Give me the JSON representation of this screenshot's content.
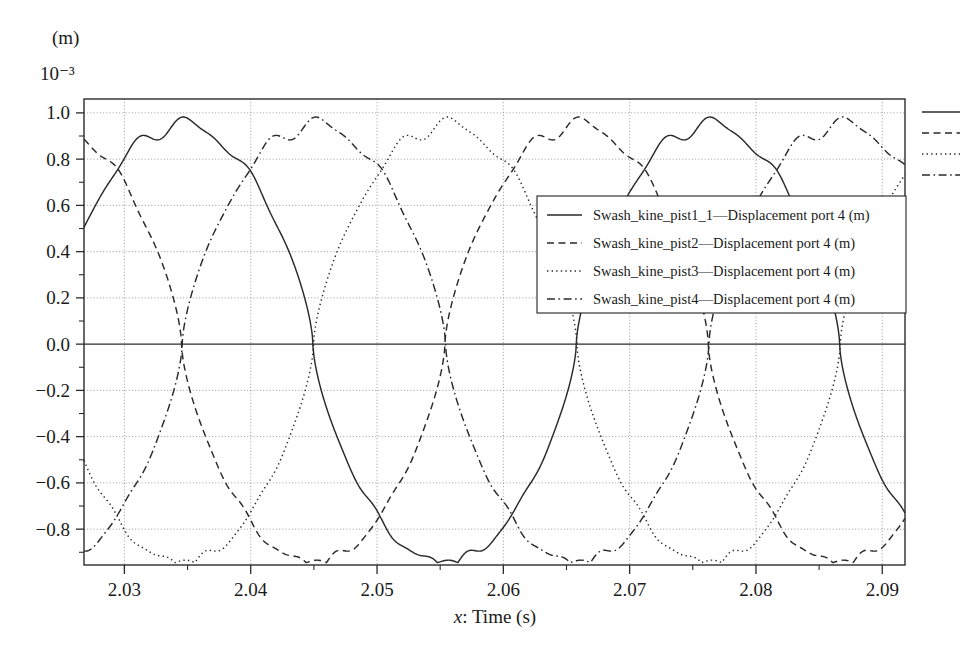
{
  "figure": {
    "y_unit_label": "(m)",
    "y_exponent_label": "10⁻³",
    "x_axis_title_prefix": "x",
    "x_axis_title_rest": ": Time (s)",
    "background_color": "#ffffff",
    "line_color": "#2a2a2a",
    "grid_color": "#8d8d8d"
  },
  "chart_data": {
    "type": "line",
    "title": "",
    "subtitle": "",
    "xlabel": "x: Time (s)",
    "ylabel": "(m)",
    "y_scale_exponent": "10^-3",
    "xlim": [
      2.0268,
      2.0918
    ],
    "ylim": [
      -0.955,
      1.06
    ],
    "xticks": [
      2.03,
      2.04,
      2.05,
      2.06,
      2.07,
      2.08,
      2.09
    ],
    "xtick_labels": [
      "2.03",
      "2.04",
      "2.05",
      "2.06",
      "2.07",
      "2.08",
      "2.09"
    ],
    "x_minor_tick_step": 0.005,
    "yticks": [
      1.0,
      0.8,
      0.6,
      0.4,
      0.2,
      0.0,
      -0.2,
      -0.4,
      -0.6,
      -0.8
    ],
    "ytick_labels": [
      "1.0",
      "0.8",
      "0.6",
      "0.4",
      "0.2",
      "0.0",
      "−0.2",
      "−0.4",
      "−0.6",
      "−0.8"
    ],
    "y_minor_tick_step": 0.1,
    "grid": true,
    "grid_style": "dotted",
    "zero_line": true,
    "legend_position": "center-right-inside",
    "period_seconds": 0.0417,
    "amplitude": 0.95,
    "wave_shape": "trapezoidal-with-peak-ripple",
    "series": [
      {
        "name": "Swash_kine_pist1_1—Displacement port 4 (m)",
        "line_style": "solid",
        "phase_offset_seconds": 0.0,
        "peak_times": [
          2.0345,
          2.0762
        ],
        "trough_times": [
          2.0555
        ],
        "zero_crossings_falling": [
          2.0459
        ],
        "zero_crossings_rising": [
          2.0659
        ]
      },
      {
        "name": "Swash_kine_pist2—Displacement port 4 (m)",
        "line_style": "dashed",
        "phase_offset_seconds": -0.0104,
        "peak_times": [
          2.0293,
          2.071,
          2.0918
        ],
        "trough_times": [
          2.0502
        ],
        "zero_crossings_falling": [
          2.0407
        ],
        "zero_crossings_rising": [
          2.0607
        ]
      },
      {
        "name": "Swash_kine_pist3—Displacement port 4 (m)",
        "line_style": "dotted",
        "phase_offset_seconds": -0.0208,
        "peak_times": [
          2.0658,
          2.0866
        ],
        "trough_times": [
          2.045,
          2.0867
        ],
        "zero_crossings_falling": [
          2.0303
        ],
        "zero_crossings_rising": [
          2.0555
        ]
      },
      {
        "name": "Swash_kine_pist4—Displacement port 4 (m)",
        "line_style": "dashdot",
        "phase_offset_seconds": -0.0312,
        "peak_times": [
          2.0606,
          2.0814
        ],
        "trough_times": [
          2.0398,
          2.0815
        ],
        "zero_crossings_falling": [
          2.029
        ],
        "zero_crossings_rising": [
          2.0502
        ]
      }
    ]
  },
  "legend": {
    "entries": [
      {
        "label": "Swash_kine_pist1_1—Displacement port 4 (m)",
        "style": "solid"
      },
      {
        "label": "Swash_kine_pist2—Displacement port 4 (m)",
        "style": "dashed"
      },
      {
        "label": "Swash_kine_pist3—Displacement port 4 (m)",
        "style": "dotted"
      },
      {
        "label": "Swash_kine_pist4—Displacement port 4 (m)",
        "style": "dashdot"
      }
    ]
  },
  "side_legend_swatches": [
    {
      "style": "solid"
    },
    {
      "style": "dashed"
    },
    {
      "style": "dotted"
    },
    {
      "style": "dashdot"
    }
  ]
}
